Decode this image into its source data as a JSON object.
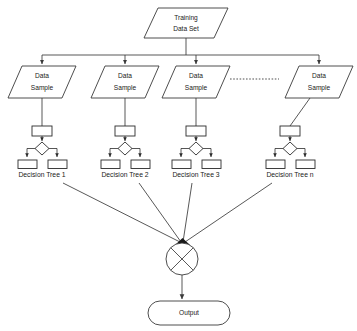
{
  "diagram": {
    "title_node": {
      "name": "training-data-set",
      "shape": "parallelogram",
      "line1": "Training",
      "line2": "Data Set",
      "cx": 186,
      "cy": 22
    },
    "samples": [
      {
        "line1": "Data",
        "line2": "Sample",
        "cx": 42,
        "cy": 82
      },
      {
        "line1": "Data",
        "line2": "Sample",
        "cx": 125,
        "cy": 82
      },
      {
        "line1": "Data",
        "line2": "Sample",
        "cx": 196,
        "cy": 82
      },
      {
        "line1": "Data",
        "line2": "Sample",
        "cx": 319,
        "cy": 82
      }
    ],
    "ellipsis": {
      "name": "ellipsis-dots",
      "x1": 230,
      "x2": 279,
      "y": 79
    },
    "trees": [
      {
        "label": "Decision Tree 1",
        "cx": 42,
        "label_y": 175
      },
      {
        "label": "Decision Tree 2",
        "cx": 125,
        "label_y": 175
      },
      {
        "label": "Decision Tree 3",
        "cx": 196,
        "label_y": 175
      },
      {
        "label": "Decision Tree n",
        "cx": 290,
        "label_y": 175
      }
    ],
    "aggregator": {
      "name": "aggregation-node",
      "symbol": "x-circle",
      "cx": 182,
      "cy": 259,
      "r": 16
    },
    "output_node": {
      "name": "output-node",
      "shape": "stadium",
      "label": "Output",
      "cx": 189,
      "cy": 313
    },
    "bus": {
      "y": 55,
      "x_left": 42,
      "x_right": 319,
      "stem_x": 186,
      "stem_top": 38
    },
    "colors": {
      "background": "#ffffff",
      "stroke": "#3a3a3a",
      "tree_stroke": "#2b2b2b",
      "text": "#1a1a1a",
      "ellipsis": "#8a8a8a"
    }
  }
}
